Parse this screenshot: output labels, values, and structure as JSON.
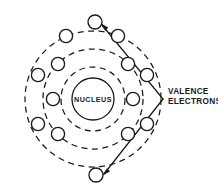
{
  "diagram": {
    "nucleus": {
      "label": "NUCLEUS",
      "cx": 93,
      "cy": 99,
      "r": 21
    },
    "callouts": [
      {
        "name": "valence-electrons",
        "line1": "VALENCE",
        "line2": "ELECTRONS",
        "vertex_x": 163,
        "vertex_y": 99
      }
    ],
    "colors": {
      "ink": "#1a1a1a",
      "background": "#ffffff"
    },
    "shells": [
      {
        "name": "inner-shell",
        "r": 32,
        "electron_count": 2
      },
      {
        "name": "middle-shell",
        "r": 50,
        "electron_count": 4
      },
      {
        "name": "outer-shell",
        "r": 68,
        "electron_count": 8
      }
    ],
    "electron_radius": 6.6,
    "electrons": [
      {
        "name": "electron-inner-left",
        "shell": "inner-shell",
        "cx": 53,
        "cy": 99
      },
      {
        "name": "electron-inner-right",
        "shell": "inner-shell",
        "cx": 133,
        "cy": 99
      },
      {
        "name": "electron-middle-upper-left",
        "shell": "middle-shell",
        "cx": 58,
        "cy": 64
      },
      {
        "name": "electron-middle-upper-right",
        "shell": "middle-shell",
        "cx": 128,
        "cy": 64
      },
      {
        "name": "electron-middle-lower-left",
        "shell": "middle-shell",
        "cx": 58,
        "cy": 134
      },
      {
        "name": "electron-middle-lower-right",
        "shell": "middle-shell",
        "cx": 128,
        "cy": 134
      },
      {
        "name": "electron-outer-top",
        "shell": "outer-shell",
        "cx": 95,
        "cy": 22,
        "valence": true
      },
      {
        "name": "electron-outer-top-left",
        "shell": "outer-shell",
        "cx": 66,
        "cy": 36
      },
      {
        "name": "electron-outer-top-right",
        "shell": "outer-shell",
        "cx": 118,
        "cy": 36
      },
      {
        "name": "electron-outer-left",
        "shell": "outer-shell",
        "cx": 38,
        "cy": 75
      },
      {
        "name": "electron-outer-right",
        "shell": "outer-shell",
        "cx": 147,
        "cy": 75
      },
      {
        "name": "electron-outer-bottom-left",
        "shell": "outer-shell",
        "cx": 38,
        "cy": 124
      },
      {
        "name": "electron-outer-bottom-right",
        "shell": "outer-shell",
        "cx": 147,
        "cy": 124
      },
      {
        "name": "electron-outer-bottom",
        "shell": "outer-shell",
        "cx": 96,
        "cy": 175,
        "valence": true
      }
    ]
  }
}
